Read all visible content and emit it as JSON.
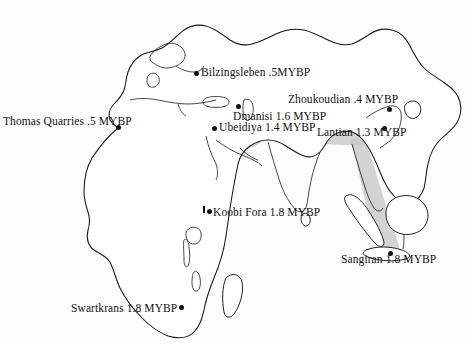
{
  "figure": {
    "name": "homo-erectus-dispersal-map",
    "background_color": "#ffffff",
    "outline_color": "#151515",
    "corridor_color": "#c9c9c9",
    "dot_color": "#0d0d0d",
    "projection_note": "Africa and Eurasia landmass outline"
  },
  "sites": [
    {
      "id": "thomas-quarries",
      "label": "Thomas Quarries .5 MYBP",
      "name": "Thomas Quarries",
      "age": ".5 MYBP",
      "label_x": 3,
      "label_y": 116,
      "dot_x": 116,
      "dot_y": 125
    },
    {
      "id": "bilzingsleben",
      "label": "Bilzingsleben .5MYBP",
      "name": "Bilzingsleben",
      "age": ".5MYBP",
      "label_x": 201,
      "label_y": 67,
      "dot_x": 194,
      "dot_y": 71
    },
    {
      "id": "dmanisi",
      "label": "Dmanisi 1.6 MYBP",
      "name": "Dmanisi",
      "age": "1.6 MYBP",
      "label_x": 233,
      "label_y": 111,
      "dot_x": 236,
      "dot_y": 104
    },
    {
      "id": "ubeidiya",
      "label": "Ubeidiya 1.4 MYBP",
      "name": "Ubeidiya",
      "age": "1.4 MYBP",
      "label_x": 219,
      "label_y": 122,
      "dot_x": 212,
      "dot_y": 126
    },
    {
      "id": "zhoukoudian",
      "label": "Zhoukoudian .4 MYBP",
      "name": "Zhoukoudian",
      "age": ".4 MYBP",
      "label_x": 288,
      "label_y": 94,
      "dot_x": 387,
      "dot_y": 107
    },
    {
      "id": "lantian",
      "label": "Lantian 1.3 MYBP",
      "name": "Lantian",
      "age": "1.3 MYBP",
      "label_x": 317,
      "label_y": 127,
      "dot_x": 382,
      "dot_y": 126
    },
    {
      "id": "koobi-fora",
      "label": "Koobi Fora 1.8 MYBP",
      "name": "Koobi Fora",
      "age": "1.8 MYBP",
      "label_x": 213,
      "label_y": 207,
      "dot_x": 207,
      "dot_y": 209
    },
    {
      "id": "sangiran",
      "label": "Sangiran 1.8 MYBP",
      "name": "Sangiran",
      "age": "1.8 MYBP",
      "label_x": 341,
      "label_y": 254,
      "dot_x": 388,
      "dot_y": 251
    },
    {
      "id": "swartkrans",
      "label": "Swartkrans 1.8 MYBP",
      "name": "Swartkrans",
      "age": "1.8 MYBP",
      "label_x": 71,
      "label_y": 303,
      "dot_x": 179,
      "dot_y": 305
    }
  ]
}
